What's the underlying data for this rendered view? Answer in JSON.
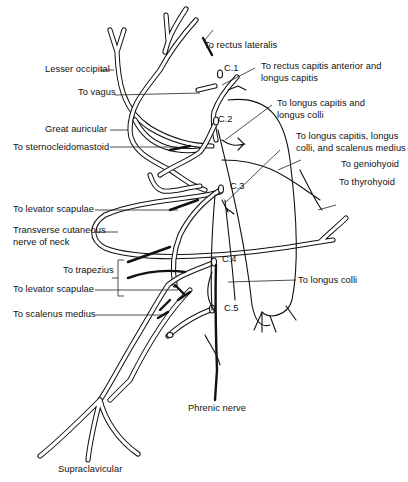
{
  "diagram": {
    "vertebral_levels": [
      "C.1",
      "C.2",
      "C.3",
      "C.4",
      "C.5"
    ],
    "labels_left": {
      "lesser_occipital": "Lesser occipital",
      "to_vagus": "To vagus",
      "great_auricular": "Great auricular",
      "to_sternocleidomastoid": "To sternocleidomastoid",
      "to_levator_scapulae_1": "To levator scapulae",
      "transverse_cutaneous_line1": "Transverse cutaneous",
      "transverse_cutaneous_line2": "nerve of neck",
      "to_trapezius": "To trapezius",
      "to_levator_scapulae_2": "To levator scapulae",
      "to_scalenus_medius": "To scalenus medius"
    },
    "labels_right": {
      "to_rectus_lateralis": "To rectus lateralis",
      "to_rectus_capitis_line1": "To rectus capitis anterior and",
      "to_rectus_capitis_line2": "longus capitis",
      "to_longus_capitis_colli_line1": "To longus capitis and",
      "to_longus_capitis_colli_line2": "longus colli",
      "to_longus_capitis_scalenus_line1": "To longus capitis, longus",
      "to_longus_capitis_scalenus_line2": "colli, and scalenus medius",
      "to_geniohyoid": "To geniohyoid",
      "to_thyrohyoid": "To thyrohyoid",
      "to_longus_colli": "To longus colli"
    },
    "labels_bottom": {
      "phrenic_nerve": "Phrenic nerve",
      "supraclavicular": "Supraclavicular"
    }
  }
}
